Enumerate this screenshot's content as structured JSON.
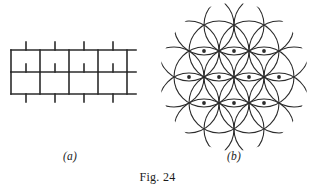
{
  "figure": {
    "caption": "Fig. 24",
    "panels": [
      {
        "id": "a",
        "sublabel": "(a)",
        "name": "brick-tessellation",
        "description": "running bond brickwork tiling",
        "stroke_color": "#2b2b2b",
        "geometry": {
          "view_width": 132,
          "view_height": 70,
          "horizontal_lines_y": [
            12,
            34,
            56
          ],
          "row_height": 22,
          "brick_width": 29,
          "left_x": 3,
          "right_x": 128,
          "stub_length": 8,
          "rows": [
            {
              "row": "top-stubs",
              "y_from": 4,
              "y_to": 12,
              "x_positions": [
                18,
                47,
                76,
                105
              ]
            },
            {
              "row": "upper",
              "y_from": 12,
              "y_to": 34,
              "x_positions": [
                3,
                32,
                61,
                90,
                119
              ]
            },
            {
              "row": "middle-stubs",
              "y_from": 26,
              "y_to": 34,
              "x_positions": [
                18,
                47,
                76,
                105
              ]
            },
            {
              "row": "lower",
              "y_from": 34,
              "y_to": 56,
              "x_positions": [
                3,
                32,
                61,
                90,
                119
              ]
            },
            {
              "row": "bottom-stubs",
              "y_from": 56,
              "y_to": 64,
              "x_positions": [
                18,
                47,
                76,
                105
              ]
            }
          ]
        }
      },
      {
        "id": "b",
        "sublabel": "(b)",
        "name": "flower-of-life-circles",
        "description": "overlapping circles on a triangular lattice",
        "stroke_color": "#2b2b2b",
        "geometry": {
          "view_width": 152,
          "view_height": 150,
          "circle_radius": 30,
          "lattice_spacing": 30,
          "row_vertical_step": 25.98,
          "center_x": 76,
          "center_y": 75,
          "centers": [
            [
              76,
              23
            ],
            [
              46,
              23
            ],
            [
              106,
              23
            ],
            [
              61,
              49
            ],
            [
              91,
              49
            ],
            [
              31,
              49
            ],
            [
              121,
              49
            ],
            [
              76,
              75
            ],
            [
              46,
              75
            ],
            [
              106,
              75
            ],
            [
              16,
              75
            ],
            [
              136,
              75
            ],
            [
              61,
              101
            ],
            [
              91,
              101
            ],
            [
              31,
              101
            ],
            [
              121,
              101
            ],
            [
              76,
              127
            ],
            [
              46,
              127
            ],
            [
              106,
              127
            ]
          ],
          "node_dots": [
            [
              76,
              49
            ],
            [
              46,
              49
            ],
            [
              106,
              49
            ],
            [
              61,
              75
            ],
            [
              91,
              75
            ],
            [
              31,
              75
            ],
            [
              121,
              75
            ],
            [
              76,
              101
            ],
            [
              46,
              101
            ],
            [
              106,
              101
            ]
          ]
        }
      }
    ]
  }
}
